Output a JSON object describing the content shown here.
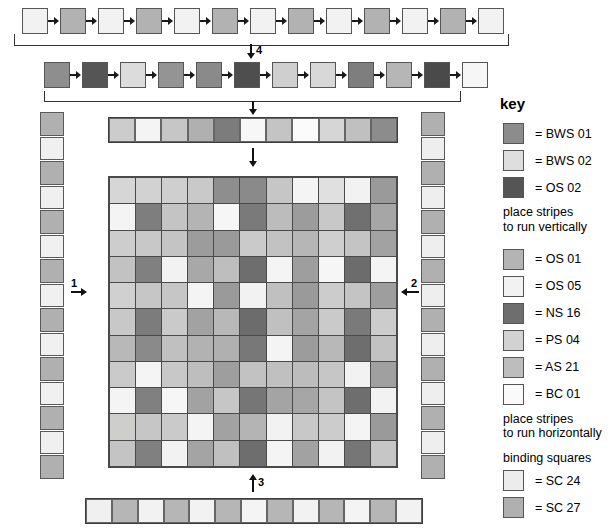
{
  "key": {
    "title": "key",
    "vertical_note": "place stripes\nto run vertically",
    "horizontal_note": "place stripes\nto run horizontally",
    "binding_heading": "binding squares",
    "group_vertical": [
      {
        "label": "= BWS 01",
        "color": "#8c8c8c"
      },
      {
        "label": "= BWS 02",
        "color": "#dedede"
      },
      {
        "label": "= OS 02",
        "color": "#555555"
      }
    ],
    "group_horizontal": [
      {
        "label": "= OS 01",
        "color": "#b4b4b4"
      },
      {
        "label": "= OS 05",
        "color": "#f2f2f2"
      },
      {
        "label": "= NS 16",
        "color": "#6e6e6e"
      },
      {
        "label": "= PS 04",
        "color": "#d2d2d2"
      },
      {
        "label": "= AS 21",
        "color": "#bdbdbd"
      },
      {
        "label": "= BC 01",
        "color": "#fafafa"
      }
    ],
    "group_binding": [
      {
        "label": "= SC 24",
        "color": "#ececec"
      },
      {
        "label": "= SC 27",
        "color": "#b0b0b0"
      }
    ]
  },
  "arrows": {
    "a1": "1",
    "a2": "2",
    "a3": "3",
    "a4": "4"
  },
  "palette": {
    "L1": "#f4f4f4",
    "L2": "#e4e4e4",
    "L3": "#d2d2d2",
    "M1": "#bdbdbd",
    "M2": "#ababab",
    "M3": "#949494",
    "D1": "#7d7d7d",
    "D2": "#6a6a6a",
    "D3": "#555555"
  },
  "sequence_row_1": [
    "#f2f2f2",
    "#b2b2b2",
    "#f2f2f2",
    "#b2b2b2",
    "#f2f2f2",
    "#b2b2b2",
    "#f2f2f2",
    "#b2b2b2",
    "#f2f2f2",
    "#b2b2b2",
    "#f2f2f2",
    "#b2b2b2",
    "#f2f2f2"
  ],
  "sequence_row_2": [
    "#8e8e8e",
    "#555555",
    "#dcdcdc",
    "#949494",
    "#8a8a8a",
    "#4e4e4e",
    "#cfcfcf",
    "#d8d8d8",
    "#7e7e7e",
    "#b6b6b6",
    "#4a4a4a",
    "#f6f6f6"
  ],
  "top_strip": [
    "#cccccc",
    "#f4f4f4",
    "#c6c6c6",
    "#b0b0b0",
    "#7c7c7c",
    "#f7f7f7",
    "#c4c4c4",
    "#fbfbfb",
    "#d6d6d6",
    "#c0c0c0",
    "#8c8c8c"
  ],
  "bottom_strip": [
    "#f0f0f0",
    "#b6b6b6",
    "#f2f2f2",
    "#b6b6b6",
    "#f2f2f2",
    "#b6b6b6",
    "#f4f4f4",
    "#b6b6b6",
    "#f2f2f2",
    "#b6b6b6",
    "#f4f4f4",
    "#b6b6b6",
    "#f2f2f2"
  ],
  "left_column": [
    "#b0b0b0",
    "#f0f0f0",
    "#b0b0b0",
    "#f0f0f0",
    "#b0b0b0",
    "#f0f0f0",
    "#b0b0b0",
    "#f0f0f0",
    "#b0b0b0",
    "#f0f0f0",
    "#b0b0b0",
    "#f0f0f0",
    "#b0b0b0",
    "#f0f0f0",
    "#b0b0b0"
  ],
  "right_column": [
    "#b0b0b0",
    "#eeeeee",
    "#b0b0b0",
    "#eeeeee",
    "#b0b0b0",
    "#eeeeee",
    "#b0b0b0",
    "#eeeeee",
    "#b0b0b0",
    "#eeeeee",
    "#b0b0b0",
    "#eeeeee",
    "#b0b0b0",
    "#eeeeee",
    "#b0b0b0"
  ],
  "grid": {
    "rows": 11,
    "cols": 11,
    "cells": [
      [
        "#d6d6d6",
        "#d2d2d2",
        "#cfcfcf",
        "#c9c9c9",
        "#8e8e8e",
        "#8a8a8a",
        "#c6c6c6",
        "#f4f4f4",
        "#e0e0e0",
        "#f2f2f2",
        "#9a9a9a"
      ],
      [
        "#f4f4f4",
        "#7e7e7e",
        "#c4c4c4",
        "#b4b4b4",
        "#f6f6f6",
        "#7a7a7a",
        "#bcbcbc",
        "#9c9c9c",
        "#c8c8c8",
        "#707070",
        "#a6a6a6"
      ],
      [
        "#cdcdcd",
        "#c8c8c8",
        "#c4c4c4",
        "#9c9c9c",
        "#9a9a9a",
        "#cacaca",
        "#c2c2c2",
        "#b6b6b6",
        "#cfcfcf",
        "#c4c4c4",
        "#a2a2a2"
      ],
      [
        "#c2c2c2",
        "#808080",
        "#f2f2f2",
        "#a8a8a8",
        "#bebebe",
        "#6e6e6e",
        "#f4f4f4",
        "#9e9e9e",
        "#f6f6f6",
        "#6c6c6c",
        "#f4f4f4"
      ],
      [
        "#d0d0d0",
        "#c6c6c6",
        "#c6c6c6",
        "#f4f4f4",
        "#9a9a9a",
        "#f2f2f2",
        "#c0c0c0",
        "#9a9a9a",
        "#cccccc",
        "#c4c4c4",
        "#9e9e9e"
      ],
      [
        "#c8c8c8",
        "#7c7c7c",
        "#cacaca",
        "#a2a2a2",
        "#b8b8b8",
        "#6c6c6c",
        "#c0c0c0",
        "#a4a4a4",
        "#cacaca",
        "#7a7a7a",
        "#cccccc"
      ],
      [
        "#b8b8b8",
        "#8a8a8a",
        "#c0c0c0",
        "#b2b2b2",
        "#b0b0b0",
        "#787878",
        "#f4f4f4",
        "#9c9c9c",
        "#b8b8b8",
        "#6e6e6e",
        "#c2c2c2"
      ],
      [
        "#cacaca",
        "#f4f4f4",
        "#c8c8c8",
        "#bebebe",
        "#9e9e9e",
        "#c2c2c2",
        "#c0c0c0",
        "#bcbcbc",
        "#c6c6c6",
        "#f2f2f2",
        "#a0a0a0"
      ],
      [
        "#f4f4f4",
        "#808080",
        "#f6f6f6",
        "#a2a2a2",
        "#c6c6c6",
        "#767676",
        "#a4a4a4",
        "#a6a6a6",
        "#c4c4c4",
        "#6e6e6e",
        "#f2f2f2"
      ],
      [
        "#cececd",
        "#c6c6c6",
        "#cacaca",
        "#f4f4f4",
        "#a2a2a2",
        "#b4b4b4",
        "#f2f2f2",
        "#c8c8c8",
        "#cccccc",
        "#f4f4f4",
        "#9a9a9a"
      ],
      [
        "#c4c4c4",
        "#808080",
        "#f2f2f2",
        "#a4a4a4",
        "#c0c0c0",
        "#6e6e6e",
        "#f4f4f4",
        "#a2a2a2",
        "#f2f2f2",
        "#767676",
        "#c6c6c6"
      ]
    ]
  }
}
